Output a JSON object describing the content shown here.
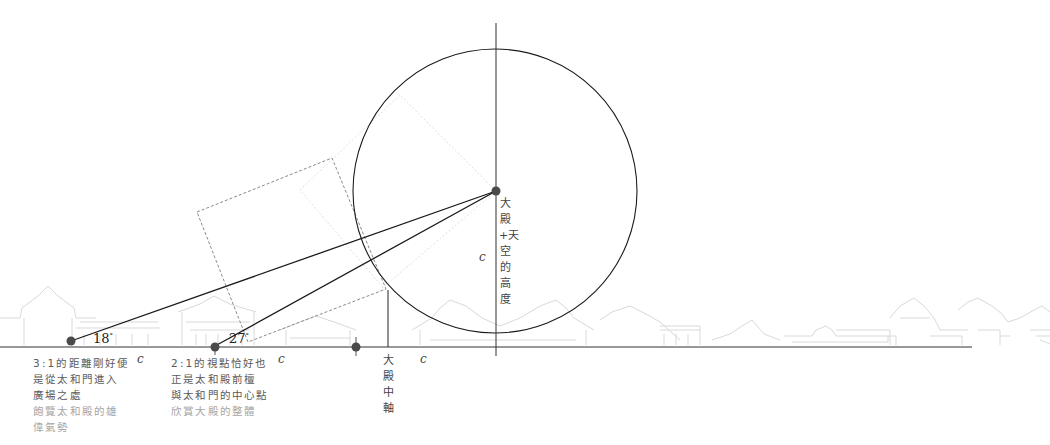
{
  "diagram": {
    "type": "viewing-angle geometry diagram",
    "colors": {
      "main_line": "#1a1a1a",
      "dashed_square": "#8a8a8a",
      "faint_square": "#dcdcdc",
      "buildings": "#d8d8d8",
      "dot": "#4a4a4a",
      "text_dark": "#5a5a5a",
      "text_light": "#a6a6a6"
    },
    "angles": [
      {
        "value": "18",
        "unit": "°"
      },
      {
        "value": "27",
        "unit": "°"
      }
    ],
    "c_labels": [
      "c",
      "c",
      "c",
      "c"
    ],
    "vertical_labels": {
      "height": "大殿+天空的高度",
      "axis": "大殿中軸"
    },
    "notes": [
      {
        "dark_lines": [
          "3:1的距離剛好便",
          "是從太和門進入",
          "廣場之處"
        ],
        "light_lines": [
          "飽覽太和殿的雄",
          "偉氣勢"
        ]
      },
      {
        "dark_lines": [
          "2:1的視點恰好也",
          "正是太和殿前檀",
          "與太和門的中心點"
        ],
        "light_lines": [
          "欣賞大殿的整體"
        ]
      }
    ]
  }
}
